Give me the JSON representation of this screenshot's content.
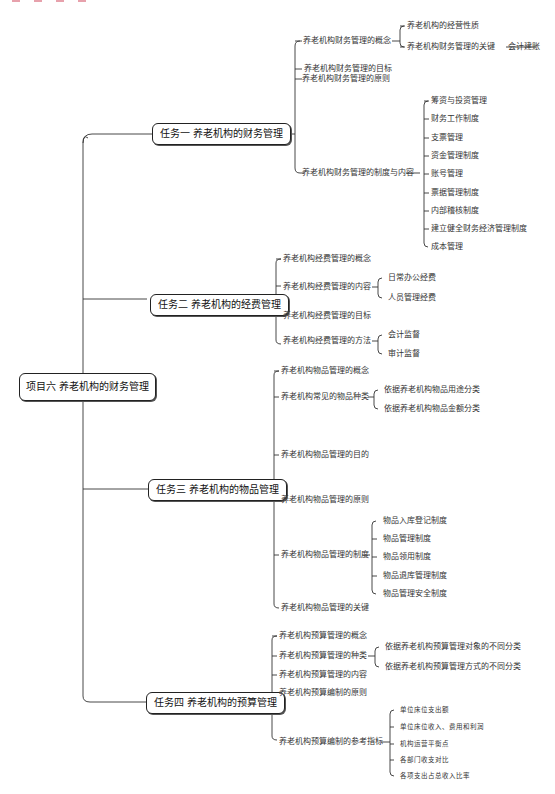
{
  "root": {
    "label": "项目六  养老机构的财务管理"
  },
  "tasks": [
    {
      "label": "任务一  养老机构的财务管理",
      "children": [
        {
          "label": "养老机构财务管理的概念",
          "children": [
            "养老机构的经营性质",
            "养老机构财务管理的关键"
          ],
          "extra": "会计建账"
        },
        {
          "label": "养老机构财务管理的目标"
        },
        {
          "label": "养老机构财务管理的原则"
        },
        {
          "label": "养老机构财务管理的制度与内容",
          "children": [
            "筹资与投资管理",
            "财务工作制度",
            "支票管理",
            "资金管理制度",
            "账号管理",
            "票据管理制度",
            "内部稽核制度",
            "建立健全财务经济管理制度",
            "成本管理"
          ]
        }
      ]
    },
    {
      "label": "任务二  养老机构的经费管理",
      "children": [
        {
          "label": "养老机构经费管理的概念"
        },
        {
          "label": "养老机构经费管理的内容",
          "children": [
            "日常办公经费",
            "人员管理经费"
          ]
        },
        {
          "label": "养老机构经费管理的目标"
        },
        {
          "label": "养老机构经费管理的方法",
          "children": [
            "会计监督",
            "审计监督"
          ]
        }
      ]
    },
    {
      "label": "任务三  养老机构的物品管理",
      "children": [
        {
          "label": "养老机构物品管理的概念"
        },
        {
          "label": "养老机构常见的物品种类",
          "children": [
            "依据养老机构物品用途分类",
            "依据养老机构物品金额分类"
          ]
        },
        {
          "label": "养老机构物品管理的目的"
        },
        {
          "label": "养老机构物品管理的原则"
        },
        {
          "label": "养老机构物品管理的制度",
          "children": [
            "物品入库登记制度",
            "物品管理制度",
            "物品领用制度",
            "物品退库管理制度",
            "物品管理安全制度"
          ]
        },
        {
          "label": "养老机构物品管理的关键"
        }
      ]
    },
    {
      "label": "任务四  养老机构的预算管理",
      "children": [
        {
          "label": "养老机构预算管理的概念"
        },
        {
          "label": "养老机构预算管理的种类",
          "children": [
            "依据养老机构预算管理对象的不同分类",
            "依据养老机构预算管理方式的不同分类"
          ]
        },
        {
          "label": "养老机构预算管理的内容"
        },
        {
          "label": "养老机构预算编制的原则"
        },
        {
          "label": "养老机构预算编制的参考指标",
          "children": [
            "单位床位支出额",
            "单位床位收入、费用和利润",
            "机构运营平衡点",
            "各部门收支对比",
            "各项支出占总收入比率"
          ]
        }
      ]
    }
  ],
  "colors": {
    "line": "#333333",
    "text": "#222222",
    "accent_mark": "#d0455a"
  }
}
